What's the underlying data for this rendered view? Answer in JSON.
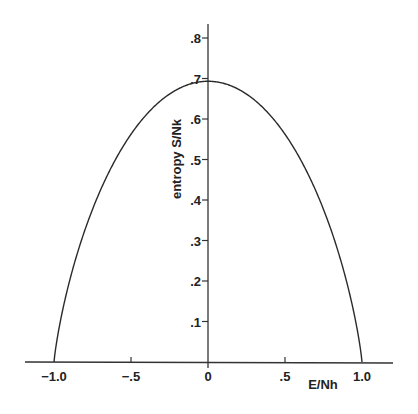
{
  "chart_data": {
    "type": "line",
    "title": "",
    "xlabel": "E/Nh",
    "ylabel": "entropy S/Nk",
    "xlim": [
      -1.0,
      1.0
    ],
    "ylim": [
      0,
      0.8
    ],
    "grid": false,
    "legend": "none",
    "x_ticks": [
      -1.0,
      -0.5,
      0,
      0.5,
      1.0
    ],
    "x_tick_labels": [
      "−1.0",
      "−.5",
      "0",
      ".5",
      "1.0"
    ],
    "y_ticks": [
      0.1,
      0.2,
      0.3,
      0.4,
      0.5,
      0.6,
      0.7,
      0.8
    ],
    "y_tick_labels": [
      ".1",
      ".2",
      ".3",
      ".4",
      ".5",
      ".6",
      ".7",
      ".8"
    ],
    "series": [
      {
        "name": "S/Nk",
        "function": "-[(1-x)/2 ln((1-x)/2) + (1+x)/2 ln((1+x)/2)]",
        "x": [
          -1.0,
          -0.95,
          -0.9,
          -0.8,
          -0.7,
          -0.6,
          -0.5,
          -0.4,
          -0.3,
          -0.2,
          -0.1,
          0.0,
          0.1,
          0.2,
          0.3,
          0.4,
          0.5,
          0.6,
          0.7,
          0.8,
          0.9,
          0.95,
          1.0
        ],
        "y": [
          0.0,
          0.1404,
          0.2362,
          0.3251,
          0.4227,
          0.5004,
          0.5623,
          0.6109,
          0.6474,
          0.673,
          0.6881,
          0.6931,
          0.6881,
          0.673,
          0.6474,
          0.6109,
          0.5623,
          0.5004,
          0.4227,
          0.3251,
          0.2362,
          0.1404,
          0.0
        ]
      }
    ],
    "peak": {
      "x": 0,
      "y": 0.693
    }
  }
}
